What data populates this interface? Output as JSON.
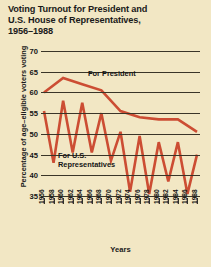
{
  "title": {
    "line1": "Voting Turnout for President and",
    "line2": "U.S. House of Representatives,",
    "line3": "1956–1988"
  },
  "annotations": {
    "president": "For President",
    "house_line1": "For U.S.",
    "house_line2": "Representatives"
  },
  "colors": {
    "background": "#f2e7c4",
    "series": "#cc4d33",
    "axis": "#3a3528",
    "text": "#151515"
  },
  "chart_data": {
    "type": "line",
    "title": "Voting Turnout for President and U.S. House of Representatives, 1956–1988",
    "xlabel": "Years",
    "ylabel": "Percentage of age–eligible voters voting",
    "ylim": [
      35,
      70
    ],
    "ytick_step": 5,
    "yticks": [
      70,
      65,
      60,
      55,
      50,
      45,
      40,
      35
    ],
    "xlim": [
      1956,
      1988
    ],
    "x": [
      1956,
      1958,
      1960,
      1962,
      1964,
      1966,
      1968,
      1970,
      1972,
      1974,
      1976,
      1978,
      1980,
      1982,
      1984,
      1986,
      1988
    ],
    "xticks": [
      "1956",
      "1958",
      "1960",
      "1962",
      "1964",
      "1966",
      "1968",
      "1970",
      "1972",
      "1974",
      "1976",
      "1978",
      "1980",
      "1982",
      "1984",
      "1986",
      "1988"
    ],
    "grid": true,
    "legend_position": "inline-annotation",
    "series": [
      {
        "name": "For President",
        "color": "#cc4d33",
        "x": [
          1956,
          1960,
          1964,
          1968,
          1972,
          1976,
          1980,
          1984,
          1988
        ],
        "values": [
          60.0,
          63.5,
          62.0,
          60.5,
          55.5,
          54.0,
          53.5,
          53.5,
          50.5
        ]
      },
      {
        "name": "For U.S. Representatives",
        "color": "#cc4d33",
        "x": [
          1956,
          1958,
          1960,
          1962,
          1964,
          1966,
          1968,
          1970,
          1972,
          1974,
          1976,
          1978,
          1980,
          1982,
          1984,
          1986,
          1988
        ],
        "values": [
          55.5,
          43.0,
          58.0,
          45.5,
          57.5,
          45.5,
          55.0,
          43.5,
          50.5,
          36.0,
          49.5,
          35.5,
          48.0,
          38.5,
          48.0,
          35.5,
          45.0
        ]
      }
    ]
  }
}
